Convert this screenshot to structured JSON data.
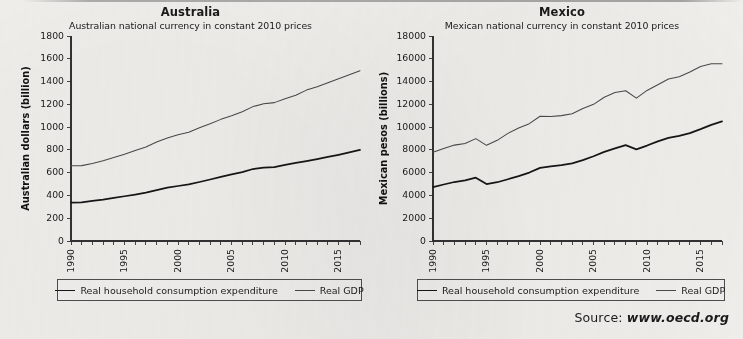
{
  "source": {
    "label": "Source:",
    "url": "www.oecd.org"
  },
  "legend": {
    "consumption_label": "Real household consumption expenditure",
    "gdp_label": "Real GDP"
  },
  "colors": {
    "consumption_line": "#161616",
    "gdp_line": "#4a4a4a",
    "axis": "#333333",
    "background": "#f2f1ee"
  },
  "chart_data": [
    {
      "type": "line",
      "panel": "australia",
      "title": "Australia",
      "subtitle": "Australian national currency in constant 2010 prices",
      "xlabel": "",
      "ylabel": "Australian dollars (billion)",
      "ylim": [
        0,
        1800
      ],
      "yticks": [
        0,
        200,
        400,
        600,
        800,
        1000,
        1200,
        1400,
        1600,
        1800
      ],
      "xlim": [
        1990,
        2017
      ],
      "xticks": [
        1990,
        1991,
        1992,
        1993,
        1994,
        1995,
        1996,
        1997,
        1998,
        1999,
        2000,
        2001,
        2002,
        2003,
        2004,
        2005,
        2006,
        2007,
        2008,
        2009,
        2010,
        2011,
        2012,
        2013,
        2014,
        2015,
        2016,
        2017
      ],
      "xtick_labels": [
        1990,
        1995,
        2000,
        2005,
        2010,
        2015
      ],
      "grid": false,
      "legend_position": "below",
      "x": [
        1990,
        1991,
        1992,
        1993,
        1994,
        1995,
        1996,
        1997,
        1998,
        1999,
        2000,
        2001,
        2002,
        2003,
        2004,
        2005,
        2006,
        2007,
        2008,
        2009,
        2010,
        2011,
        2012,
        2013,
        2014,
        2015,
        2016,
        2017
      ],
      "series": [
        {
          "name": "Real GDP",
          "values": [
            660,
            662,
            680,
            705,
            733,
            762,
            795,
            825,
            870,
            905,
            932,
            955,
            995,
            1030,
            1068,
            1100,
            1135,
            1180,
            1205,
            1215,
            1250,
            1280,
            1325,
            1355,
            1390,
            1425,
            1460,
            1495
          ]
        },
        {
          "name": "Real household consumption expenditure",
          "values": [
            338,
            340,
            352,
            363,
            378,
            393,
            408,
            424,
            446,
            468,
            483,
            497,
            518,
            540,
            563,
            585,
            605,
            632,
            645,
            648,
            668,
            686,
            702,
            719,
            738,
            757,
            778,
            800
          ]
        }
      ]
    },
    {
      "type": "line",
      "panel": "mexico",
      "title": "Mexico",
      "subtitle": "Mexican national currency in constant 2010 prices",
      "xlabel": "",
      "ylabel": "Mexican pesos (billions)",
      "ylim": [
        0,
        18000
      ],
      "yticks": [
        0,
        2000,
        4000,
        6000,
        8000,
        10000,
        12000,
        14000,
        16000,
        18000
      ],
      "xlim": [
        1990,
        2017
      ],
      "xticks": [
        1990,
        1991,
        1992,
        1993,
        1994,
        1995,
        1996,
        1997,
        1998,
        1999,
        2000,
        2001,
        2002,
        2003,
        2004,
        2005,
        2006,
        2007,
        2008,
        2009,
        2010,
        2011,
        2012,
        2013,
        2014,
        2015,
        2016,
        2017
      ],
      "xtick_labels": [
        1990,
        1995,
        2000,
        2005,
        2010,
        2015
      ],
      "grid": false,
      "legend_position": "below",
      "x": [
        1990,
        1991,
        1992,
        1993,
        1994,
        1995,
        1996,
        1997,
        1998,
        1999,
        2000,
        2001,
        2002,
        2003,
        2004,
        2005,
        2006,
        2007,
        2008,
        2009,
        2010,
        2011,
        2012,
        2013,
        2014,
        2015,
        2016,
        2017
      ],
      "series": [
        {
          "name": "Real GDP",
          "values": [
            7800,
            8130,
            8420,
            8560,
            8990,
            8400,
            8840,
            9450,
            9930,
            10300,
            10950,
            10930,
            11010,
            11180,
            11640,
            12000,
            12620,
            13030,
            13190,
            12540,
            13220,
            13720,
            14220,
            14420,
            14840,
            15330,
            15560,
            15560
          ]
        },
        {
          "name": "Real household consumption expenditure",
          "values": [
            4730,
            4960,
            5180,
            5320,
            5560,
            5000,
            5160,
            5420,
            5700,
            6010,
            6420,
            6560,
            6660,
            6820,
            7100,
            7440,
            7830,
            8130,
            8420,
            8050,
            8380,
            8750,
            9050,
            9230,
            9470,
            9820,
            10200,
            10500
          ]
        }
      ]
    }
  ]
}
